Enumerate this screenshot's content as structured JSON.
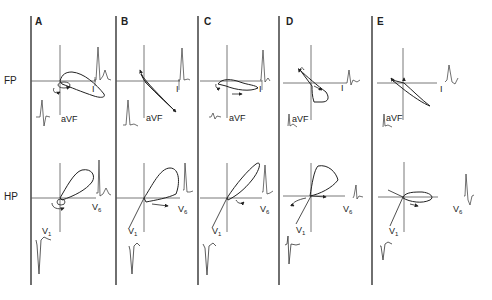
{
  "figure": {
    "row_labels": {
      "frontal": "FP",
      "horizontal": "HP"
    },
    "lead_labels": {
      "lead_I": "I",
      "aVF": "aVF",
      "V1": "V",
      "V1_sub": "1",
      "V6": "V",
      "V6_sub": "6"
    },
    "colors": {
      "line": "#222222",
      "axis": "#555555",
      "background": "#ffffff"
    },
    "panels": [
      {
        "id": "A",
        "label": "A"
      },
      {
        "id": "B",
        "label": "B"
      },
      {
        "id": "C",
        "label": "C"
      },
      {
        "id": "D",
        "label": "D"
      },
      {
        "id": "E",
        "label": "E"
      }
    ]
  }
}
